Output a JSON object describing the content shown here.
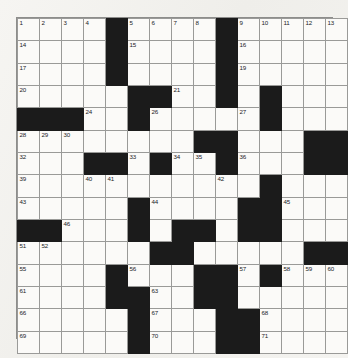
{
  "document": {
    "type": "crossword-puzzle-grid",
    "title": "Crossword Puzzle Grid",
    "size": {
      "rows": 15,
      "columns": 15
    },
    "colors": {
      "paper": "#f2f1ee",
      "cell_fill": "#fbfaf8",
      "block_fill": "#1b1b1b",
      "grid_line": "#9a9a98",
      "number_text": "#23231f"
    },
    "margin_note": {
      "visible": true,
      "legible": false,
      "text": ""
    }
  },
  "grid": {
    "legend": {
      "open": ".",
      "block": "#"
    },
    "rows": [
      "....#....#.....",
      "....#....#.....",
      "....#....#.....",
      ".....##..#.#...",
      "###..#.....#...",
      "........##...##",
      "...##.#..#...##",
      "...........#...",
      ".....#....##...",
      "##...#.##.##...",
      "......##.....##",
      "....#...##.#...",
      "....##..##.....",
      ".....#...##....",
      ".....#...##...."
    ],
    "numbers": [
      {
        "n": 1,
        "row": 1,
        "col": 1
      },
      {
        "n": 2,
        "row": 1,
        "col": 2
      },
      {
        "n": 3,
        "row": 1,
        "col": 3
      },
      {
        "n": 4,
        "row": 1,
        "col": 4
      },
      {
        "n": 5,
        "row": 1,
        "col": 6
      },
      {
        "n": 6,
        "row": 1,
        "col": 7
      },
      {
        "n": 7,
        "row": 1,
        "col": 8
      },
      {
        "n": 8,
        "row": 1,
        "col": 9
      },
      {
        "n": 9,
        "row": 1,
        "col": 11
      },
      {
        "n": 10,
        "row": 1,
        "col": 12
      },
      {
        "n": 11,
        "row": 1,
        "col": 13
      },
      {
        "n": 12,
        "row": 1,
        "col": 14
      },
      {
        "n": 13,
        "row": 1,
        "col": 15
      },
      {
        "n": 14,
        "row": 2,
        "col": 1
      },
      {
        "n": 15,
        "row": 2,
        "col": 6
      },
      {
        "n": 16,
        "row": 2,
        "col": 11
      },
      {
        "n": 17,
        "row": 3,
        "col": 1
      },
      {
        "n": 18,
        "row": 3,
        "col": 5
      },
      {
        "n": 19,
        "row": 3,
        "col": 11
      },
      {
        "n": 20,
        "row": 4,
        "col": 1
      },
      {
        "n": 21,
        "row": 4,
        "col": 8
      },
      {
        "n": 22,
        "row": 4,
        "col": 10
      },
      {
        "n": 23,
        "row": 4,
        "col": 12
      },
      {
        "n": 24,
        "row": 5,
        "col": 4
      },
      {
        "n": 25,
        "row": 5,
        "col": 6
      },
      {
        "n": 26,
        "row": 5,
        "col": 7
      },
      {
        "n": 27,
        "row": 5,
        "col": 11
      },
      {
        "n": 28,
        "row": 6,
        "col": 1
      },
      {
        "n": 29,
        "row": 6,
        "col": 2
      },
      {
        "n": 30,
        "row": 6,
        "col": 3
      },
      {
        "n": 31,
        "row": 6,
        "col": 10
      },
      {
        "n": 32,
        "row": 7,
        "col": 1
      },
      {
        "n": 33,
        "row": 7,
        "col": 6
      },
      {
        "n": 34,
        "row": 7,
        "col": 8
      },
      {
        "n": 35,
        "row": 7,
        "col": 9
      },
      {
        "n": 36,
        "row": 7,
        "col": 11
      },
      {
        "n": 37,
        "row": 7,
        "col": 14
      },
      {
        "n": 38,
        "row": 7,
        "col": 15
      },
      {
        "n": 39,
        "row": 8,
        "col": 1
      },
      {
        "n": 40,
        "row": 8,
        "col": 4
      },
      {
        "n": 41,
        "row": 8,
        "col": 5
      },
      {
        "n": 42,
        "row": 8,
        "col": 10
      },
      {
        "n": 43,
        "row": 9,
        "col": 1
      },
      {
        "n": 44,
        "row": 9,
        "col": 7
      },
      {
        "n": 45,
        "row": 9,
        "col": 13
      },
      {
        "n": 46,
        "row": 10,
        "col": 3
      },
      {
        "n": 47,
        "row": 10,
        "col": 6
      },
      {
        "n": 48,
        "row": 10,
        "col": 9
      },
      {
        "n": 49,
        "row": 10,
        "col": 11
      },
      {
        "n": 50,
        "row": 10,
        "col": 12
      },
      {
        "n": 51,
        "row": 11,
        "col": 1
      },
      {
        "n": 52,
        "row": 11,
        "col": 2
      },
      {
        "n": 53,
        "row": 11,
        "col": 7
      },
      {
        "n": 54,
        "row": 11,
        "col": 8
      },
      {
        "n": 55,
        "row": 12,
        "col": 1
      },
      {
        "n": 56,
        "row": 12,
        "col": 6
      },
      {
        "n": 57,
        "row": 12,
        "col": 11
      },
      {
        "n": 58,
        "row": 12,
        "col": 13
      },
      {
        "n": 59,
        "row": 12,
        "col": 14
      },
      {
        "n": 60,
        "row": 12,
        "col": 15
      },
      {
        "n": 61,
        "row": 13,
        "col": 1
      },
      {
        "n": 62,
        "row": 13,
        "col": 5
      },
      {
        "n": 63,
        "row": 13,
        "col": 7
      },
      {
        "n": 64,
        "row": 13,
        "col": 9
      },
      {
        "n": 65,
        "row": 13,
        "col": 10
      },
      {
        "n": 66,
        "row": 14,
        "col": 1
      },
      {
        "n": 67,
        "row": 14,
        "col": 7
      },
      {
        "n": 68,
        "row": 14,
        "col": 12
      },
      {
        "n": 69,
        "row": 15,
        "col": 1
      },
      {
        "n": 70,
        "row": 15,
        "col": 7
      },
      {
        "n": 71,
        "row": 15,
        "col": 12
      }
    ]
  }
}
